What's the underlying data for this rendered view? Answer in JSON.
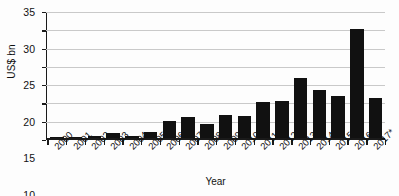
{
  "chart_data": {
    "type": "bar",
    "title": "",
    "subtitle": "",
    "xlabel": "Year",
    "ylabel": "US$ bn",
    "categories": [
      "2000",
      "2001",
      "2002",
      "2003",
      "2004",
      "2005",
      "2006",
      "2007",
      "2008",
      "2009",
      "2010",
      "2011",
      "2012",
      "2013",
      "2014",
      "2015",
      "2016",
      "2017*"
    ],
    "values": [
      0.3,
      0.25,
      0.7,
      1.5,
      0.8,
      1.9,
      4.7,
      5.9,
      3.9,
      6.4,
      6.2,
      10.0,
      10.4,
      16.7,
      13.5,
      11.7,
      30.2,
      11.1
    ],
    "series": [
      {
        "name": "US$ bn",
        "values": [
          0.3,
          0.25,
          0.7,
          1.5,
          0.8,
          1.9,
          4.7,
          5.9,
          3.9,
          6.4,
          6.2,
          10.0,
          10.4,
          16.7,
          13.5,
          11.7,
          30.2,
          11.1
        ]
      }
    ],
    "ylim": [
      0,
      35
    ],
    "yticks": [
      0,
      5,
      10,
      15,
      20,
      25,
      30,
      35
    ],
    "ytick_labels": [
      "0",
      "5",
      "10",
      "15",
      "20",
      "25",
      "30",
      "35"
    ],
    "grid": "horizontal",
    "legend": "none",
    "bar_color": "#111111",
    "grid_color": "#c9c9c9",
    "axis_color": "#1a1a1a",
    "background": "#ffffff",
    "annotations": [
      "* denotes 2017 value is provisional/estimated"
    ]
  }
}
